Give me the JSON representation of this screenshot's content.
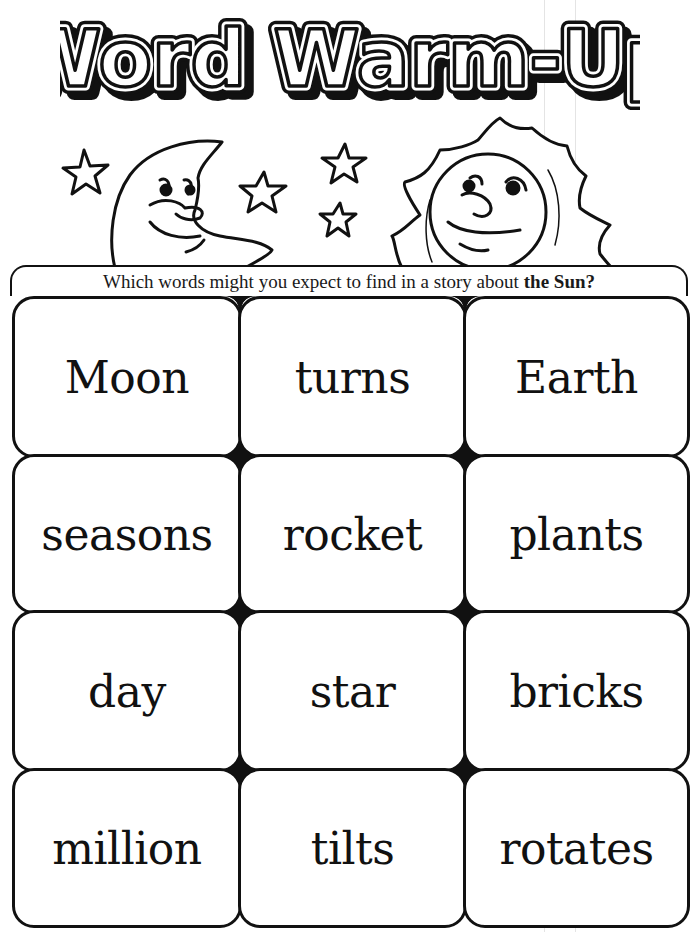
{
  "worksheet": {
    "title": "Word Warm-Up",
    "illustration": {
      "moon": "smiling-crescent-moon",
      "sun": "smiling-sun",
      "stars": 5
    },
    "question": {
      "prefix": "Which words might you expect to find in a story about",
      "topic": "the Sun",
      "suffix": "?"
    },
    "grid": {
      "columns": 3,
      "rows": 4,
      "words": [
        [
          "Moon",
          "turns",
          "Earth"
        ],
        [
          "seasons",
          "rocket",
          "plants"
        ],
        [
          "day",
          "star",
          "bricks"
        ],
        [
          "million",
          "tilts",
          "rotates"
        ]
      ]
    },
    "colors": {
      "ink": "#111111",
      "paper": "#ffffff"
    }
  }
}
